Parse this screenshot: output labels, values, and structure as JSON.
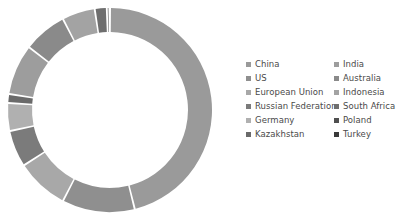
{
  "chart_data": {
    "type": "pie",
    "variant": "donut",
    "title": "",
    "subtitle": "",
    "xlabel": "",
    "ylabel": "",
    "grid": false,
    "legend_position": "right",
    "legend_columns": 2,
    "start_angle_deg": 0,
    "direction": "clockwise",
    "center": {
      "x": 110,
      "y": 110
    },
    "outer_radius": 102,
    "inner_radius": 78,
    "slice_gap_deg": 1.1,
    "categories": [
      "China",
      "US",
      "European Union",
      "Russian Federation",
      "Germany",
      "Kazakhstan",
      "India",
      "Australia",
      "Indonesia",
      "South Africa",
      "Poland",
      "Turkey"
    ],
    "values": [
      46.1,
      11.5,
      8.3,
      5.8,
      4.4,
      1.4,
      8.0,
      6.9,
      5.2,
      1.9,
      0.4,
      0.1
    ],
    "colors": [
      "#9a9a9a",
      "#8f8f8f",
      "#a8a8a8",
      "#7b7b7b",
      "#b0b0b0",
      "#6a6a6a",
      "#9d9d9d",
      "#8a8a8a",
      "#a3a3a3",
      "#6e6e6e",
      "#4f4f4f",
      "#3a3a3a"
    ]
  },
  "legend": {
    "columns": [
      {
        "items": [
          {
            "label": "China",
            "color": "#9a9a9a"
          },
          {
            "label": "US",
            "color": "#8f8f8f"
          },
          {
            "label": "European Union",
            "color": "#a8a8a8"
          },
          {
            "label": "Russian Federation",
            "color": "#7b7b7b"
          },
          {
            "label": "Germany",
            "color": "#b0b0b0"
          },
          {
            "label": "Kazakhstan",
            "color": "#6a6a6a"
          }
        ]
      },
      {
        "items": [
          {
            "label": "India",
            "color": "#9d9d9d"
          },
          {
            "label": "Australia",
            "color": "#8a8a8a"
          },
          {
            "label": "Indonesia",
            "color": "#a3a3a3"
          },
          {
            "label": "South Africa",
            "color": "#6e6e6e"
          },
          {
            "label": "Poland",
            "color": "#4f4f4f"
          },
          {
            "label": "Turkey",
            "color": "#3a3a3a"
          }
        ]
      }
    ]
  },
  "style": {
    "background": "#ffffff",
    "legend_text_color": "#4a4a4a",
    "slice_separator_color": "#ffffff"
  }
}
